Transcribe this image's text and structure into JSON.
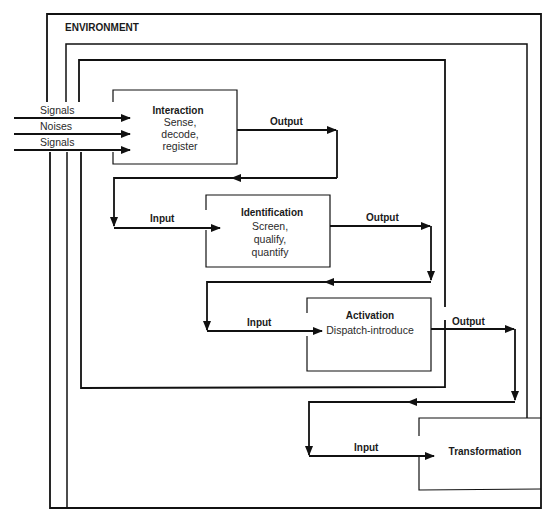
{
  "diagram": {
    "environment_label": "ENVIRONMENT",
    "inputs": {
      "signals_top": "Signals",
      "noises": "Noises",
      "signals_bottom": "Signals"
    },
    "stages": [
      {
        "title": "Interaction",
        "lines": [
          "Sense,",
          "decode,",
          "register"
        ],
        "input_label": "",
        "output_label": "Output"
      },
      {
        "title": "Identification",
        "lines": [
          "Screen,",
          "qualify,",
          "quantify"
        ],
        "input_label": "Input",
        "output_label": "Output"
      },
      {
        "title": "Activation",
        "lines": [
          "Dispatch-introduce"
        ],
        "input_label": "Input",
        "output_label": "Output"
      },
      {
        "title": "Transformation",
        "lines": [],
        "input_label": "Input",
        "output_label": ""
      }
    ],
    "colors": {
      "line": "#111111",
      "background": "#ffffff",
      "text": "#1a1a1a"
    }
  }
}
